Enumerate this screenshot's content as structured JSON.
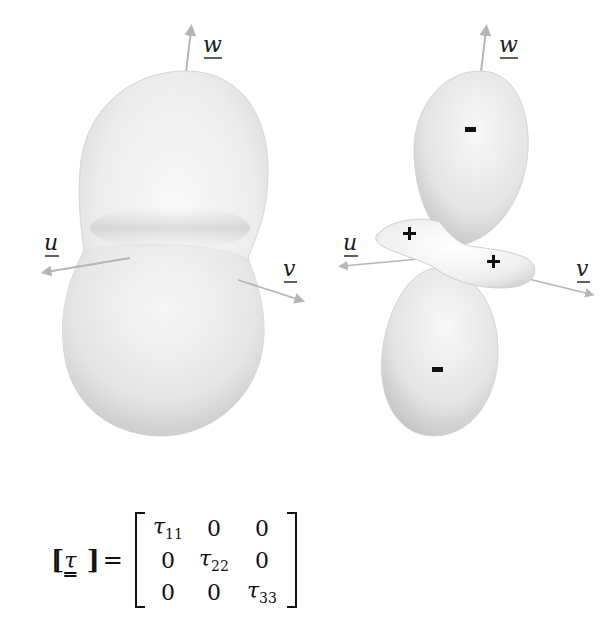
{
  "figure": {
    "left_panel": {
      "description": "peanut-shaped positive-definite tensor surface",
      "axes": {
        "u": "u",
        "v": "v",
        "w": "w"
      }
    },
    "right_panel": {
      "description": "tensor surface with indefinite lobes",
      "axes": {
        "u": "u",
        "v": "v",
        "w": "w"
      },
      "lobe_signs": {
        "upper": "-",
        "lower": "-",
        "left_ring": "+",
        "right_ring": "+"
      }
    },
    "colors": {
      "surface_light": "#f4f4f4",
      "surface_shade": "#c9c9c9",
      "axis": "#b5b5b5",
      "text": "#111111"
    }
  },
  "equation": {
    "lhs_open": "⟦",
    "lhs_symbol": "τ",
    "lhs_close": "⟧",
    "equals": "=",
    "matrix": [
      [
        {
          "sym": "τ",
          "sub": "11"
        },
        {
          "sym": "0",
          "sub": ""
        },
        {
          "sym": "0",
          "sub": ""
        }
      ],
      [
        {
          "sym": "0",
          "sub": ""
        },
        {
          "sym": "τ",
          "sub": "22"
        },
        {
          "sym": "0",
          "sub": ""
        }
      ],
      [
        {
          "sym": "0",
          "sub": ""
        },
        {
          "sym": "0",
          "sub": ""
        },
        {
          "sym": "τ",
          "sub": "33"
        }
      ]
    ]
  }
}
